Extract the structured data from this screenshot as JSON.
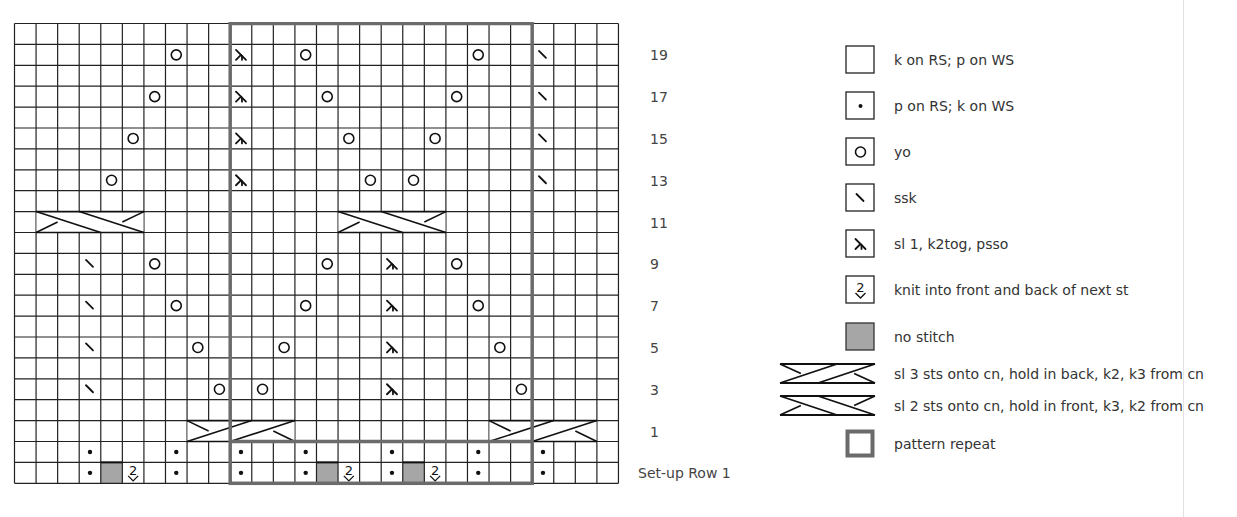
{
  "title": "",
  "chart": {
    "columns": 28,
    "rows": 22,
    "cell_w": 21.57,
    "cell_h": 20.9,
    "origin_x": 13,
    "origin_y": 22,
    "repeat": {
      "col_start": 10,
      "col_end": 23,
      "color": "#6b6b6b"
    },
    "colors": {
      "grid": "#222222",
      "no_stitch": "#a6a6a6",
      "repeat_border": "#6b6b6b"
    },
    "row_labels": [
      {
        "row_index": 1,
        "label": "19"
      },
      {
        "row_index": 3,
        "label": "17"
      },
      {
        "row_index": 5,
        "label": "15"
      },
      {
        "row_index": 7,
        "label": "13"
      },
      {
        "row_index": 9,
        "label": "11"
      },
      {
        "row_index": 11,
        "label": "9"
      },
      {
        "row_index": 13,
        "label": "7"
      },
      {
        "row_index": 15,
        "label": "5"
      },
      {
        "row_index": 17,
        "label": "3"
      },
      {
        "row_index": 19,
        "label": "1"
      },
      {
        "row_index": 21,
        "label": "Set-up Row 1"
      }
    ],
    "cells": [
      {
        "row": 1,
        "col": 7,
        "sym": "yo"
      },
      {
        "row": 1,
        "col": 10,
        "sym": "sk2p"
      },
      {
        "row": 1,
        "col": 13,
        "sym": "yo"
      },
      {
        "row": 1,
        "col": 21,
        "sym": "yo"
      },
      {
        "row": 1,
        "col": 24,
        "sym": "ssk"
      },
      {
        "row": 3,
        "col": 6,
        "sym": "yo"
      },
      {
        "row": 3,
        "col": 10,
        "sym": "sk2p"
      },
      {
        "row": 3,
        "col": 14,
        "sym": "yo"
      },
      {
        "row": 3,
        "col": 20,
        "sym": "yo"
      },
      {
        "row": 3,
        "col": 24,
        "sym": "ssk"
      },
      {
        "row": 5,
        "col": 5,
        "sym": "yo"
      },
      {
        "row": 5,
        "col": 10,
        "sym": "sk2p"
      },
      {
        "row": 5,
        "col": 15,
        "sym": "yo"
      },
      {
        "row": 5,
        "col": 19,
        "sym": "yo"
      },
      {
        "row": 5,
        "col": 24,
        "sym": "ssk"
      },
      {
        "row": 7,
        "col": 4,
        "sym": "yo"
      },
      {
        "row": 7,
        "col": 10,
        "sym": "sk2p"
      },
      {
        "row": 7,
        "col": 16,
        "sym": "yo"
      },
      {
        "row": 7,
        "col": 18,
        "sym": "yo"
      },
      {
        "row": 7,
        "col": 24,
        "sym": "ssk"
      },
      {
        "row": 11,
        "col": 3,
        "sym": "ssk"
      },
      {
        "row": 11,
        "col": 6,
        "sym": "yo"
      },
      {
        "row": 11,
        "col": 14,
        "sym": "yo"
      },
      {
        "row": 11,
        "col": 17,
        "sym": "sk2p"
      },
      {
        "row": 11,
        "col": 20,
        "sym": "yo"
      },
      {
        "row": 13,
        "col": 3,
        "sym": "ssk"
      },
      {
        "row": 13,
        "col": 7,
        "sym": "yo"
      },
      {
        "row": 13,
        "col": 13,
        "sym": "yo"
      },
      {
        "row": 13,
        "col": 17,
        "sym": "sk2p"
      },
      {
        "row": 13,
        "col": 21,
        "sym": "yo"
      },
      {
        "row": 15,
        "col": 3,
        "sym": "ssk"
      },
      {
        "row": 15,
        "col": 8,
        "sym": "yo"
      },
      {
        "row": 15,
        "col": 12,
        "sym": "yo"
      },
      {
        "row": 15,
        "col": 17,
        "sym": "sk2p"
      },
      {
        "row": 15,
        "col": 22,
        "sym": "yo"
      },
      {
        "row": 17,
        "col": 3,
        "sym": "ssk"
      },
      {
        "row": 17,
        "col": 9,
        "sym": "yo"
      },
      {
        "row": 17,
        "col": 11,
        "sym": "yo"
      },
      {
        "row": 17,
        "col": 17,
        "sym": "sk2p"
      },
      {
        "row": 17,
        "col": 23,
        "sym": "yo"
      },
      {
        "row": 20,
        "col": 3,
        "sym": "purl"
      },
      {
        "row": 20,
        "col": 7,
        "sym": "purl"
      },
      {
        "row": 20,
        "col": 10,
        "sym": "purl"
      },
      {
        "row": 20,
        "col": 13,
        "sym": "purl"
      },
      {
        "row": 20,
        "col": 17,
        "sym": "purl"
      },
      {
        "row": 20,
        "col": 21,
        "sym": "purl"
      },
      {
        "row": 20,
        "col": 24,
        "sym": "purl"
      },
      {
        "row": 21,
        "col": 3,
        "sym": "purl"
      },
      {
        "row": 21,
        "col": 4,
        "sym": "nostitch"
      },
      {
        "row": 21,
        "col": 5,
        "sym": "kfb"
      },
      {
        "row": 21,
        "col": 7,
        "sym": "purl"
      },
      {
        "row": 21,
        "col": 10,
        "sym": "purl"
      },
      {
        "row": 21,
        "col": 13,
        "sym": "purl"
      },
      {
        "row": 21,
        "col": 14,
        "sym": "nostitch"
      },
      {
        "row": 21,
        "col": 15,
        "sym": "kfb"
      },
      {
        "row": 21,
        "col": 17,
        "sym": "purl"
      },
      {
        "row": 21,
        "col": 18,
        "sym": "nostitch"
      },
      {
        "row": 21,
        "col": 19,
        "sym": "kfb"
      },
      {
        "row": 21,
        "col": 21,
        "sym": "purl"
      },
      {
        "row": 21,
        "col": 24,
        "sym": "purl"
      }
    ],
    "cables": [
      {
        "row": 9,
        "col": 1,
        "span": 5,
        "type": "front"
      },
      {
        "row": 9,
        "col": 15,
        "span": 5,
        "type": "front"
      },
      {
        "row": 19,
        "col": 8,
        "span": 5,
        "type": "back"
      },
      {
        "row": 19,
        "col": 22,
        "span": 5,
        "type": "back"
      }
    ]
  },
  "legend": {
    "items": [
      {
        "icon": "knit",
        "label": "k on RS; p on WS",
        "y": 59
      },
      {
        "icon": "purl",
        "label": "p on RS; k on WS",
        "y": 105
      },
      {
        "icon": "yo",
        "label": "yo",
        "y": 151
      },
      {
        "icon": "ssk",
        "label": "ssk",
        "y": 197
      },
      {
        "icon": "sk2p",
        "label": "sl 1, k2tog, psso",
        "y": 243
      },
      {
        "icon": "kfb",
        "label": "knit into front and back of next st",
        "y": 289
      },
      {
        "icon": "nostitch",
        "label": "no stitch",
        "y": 336
      },
      {
        "icon": "cable-back",
        "label": "sl 3 sts onto cn, hold in back, k2, k3 from cn",
        "y": 373
      },
      {
        "icon": "cable-front",
        "label": "sl 2 sts onto cn, hold in front, k3, k2 from cn",
        "y": 405
      },
      {
        "icon": "repeat",
        "label": "pattern repeat",
        "y": 443
      }
    ]
  }
}
